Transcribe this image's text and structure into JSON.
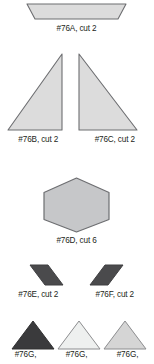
{
  "document": {
    "type": "sewing-pattern-piece-sheet",
    "background_color": "#ffffff",
    "outline_color": "#58595b",
    "text_color": "#231f20"
  },
  "pieces": [
    {
      "id": "76A",
      "label": "#76A, cut 2",
      "shape": "trapezoid",
      "fill": "#dcdcdc",
      "stroke": "#6d6e71",
      "orientation": "wide-top-narrow-bottom"
    },
    {
      "id": "76B",
      "label": "#76B, cut 2",
      "shape": "right-triangle",
      "fill": "#dcdcdc",
      "stroke": "#6d6e71",
      "orientation": "right-angle-bottom-right"
    },
    {
      "id": "76C",
      "label": "#76C, cut 2",
      "shape": "right-triangle",
      "fill": "#dcdcdc",
      "stroke": "#6d6e71",
      "orientation": "right-angle-bottom-left"
    },
    {
      "id": "76D",
      "label": "#76D, cut 6",
      "shape": "hexagon",
      "fill": "#c6c7c9",
      "stroke": "#6d6e71",
      "orientation": "flat-left-right-points"
    },
    {
      "id": "76E",
      "label": "#76E, cut 2",
      "shape": "parallelogram",
      "fill": "#4a4a4c",
      "stroke": "#3f3f41",
      "orientation": "slant-right-lean"
    },
    {
      "id": "76F",
      "label": "#76F, cut 2",
      "shape": "parallelogram",
      "fill": "#4a4a4c",
      "stroke": "#3f3f41",
      "orientation": "slant-left-lean"
    },
    {
      "id": "76G-dark",
      "label": "#76G,",
      "shape": "triangle",
      "fill": "#3a3a3c",
      "stroke": "#303031",
      "orientation": "apex-up"
    },
    {
      "id": "76G-light",
      "label": "#76G,",
      "shape": "triangle",
      "fill": "#eef0ef",
      "stroke": "#8c8d8f",
      "orientation": "apex-up"
    },
    {
      "id": "76G-mid",
      "label": "#76G,",
      "shape": "triangle",
      "fill": "#d5d5d5",
      "stroke": "#8c8d8f",
      "orientation": "apex-up"
    }
  ]
}
